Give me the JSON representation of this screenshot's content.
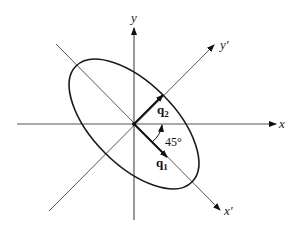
{
  "diagram": {
    "axes": {
      "x_label": "x",
      "y_label": "y",
      "x_prime_label": "x′",
      "y_prime_label": "y′"
    },
    "vectors": {
      "q1": {
        "base": "q",
        "sub": "1"
      },
      "q2": {
        "base": "q",
        "sub": "2"
      }
    },
    "angle_label": "45°",
    "ellipse": {
      "rotation_deg": 45,
      "semi_major": 82,
      "semi_minor": 41
    },
    "colors": {
      "line": "#555555",
      "ellipse": "#1a1a1a",
      "vector": "#111111"
    }
  }
}
